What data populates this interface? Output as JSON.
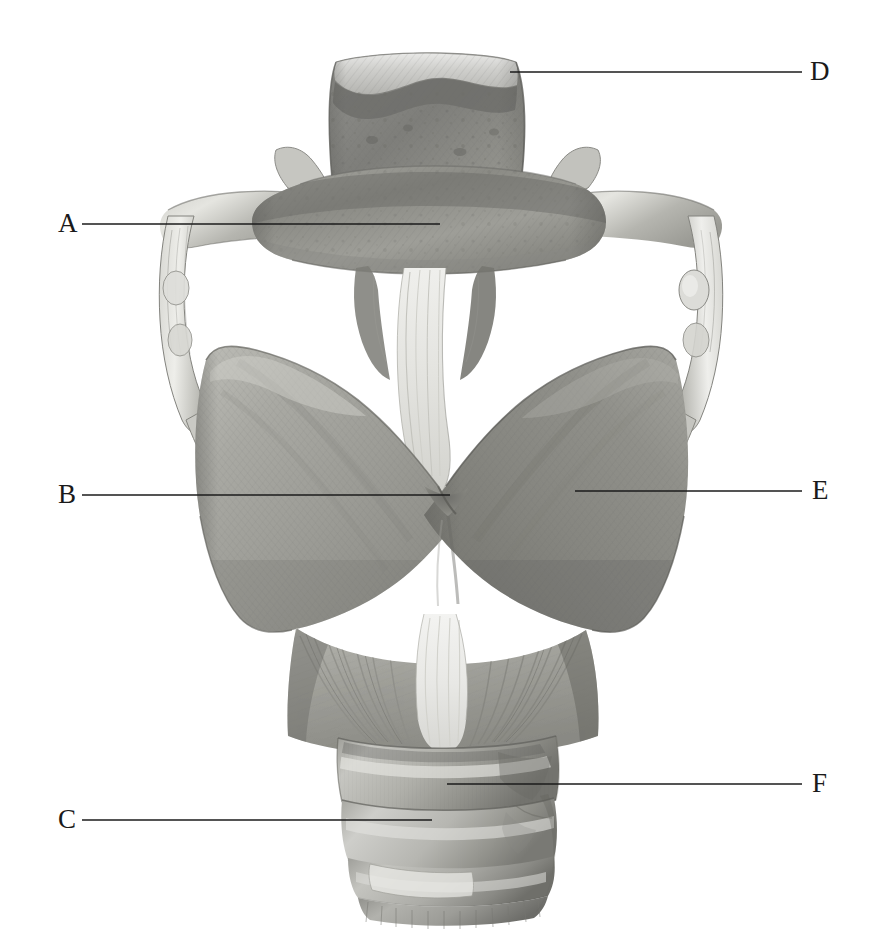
{
  "figure": {
    "background_color": "#ffffff",
    "ink_color": "#1b1b1b",
    "illustration_style": "grayscale graphite rendering",
    "width": 875,
    "height": 929
  },
  "labels": [
    {
      "id": "label-a",
      "text": "A",
      "side": "left",
      "text_x": 58,
      "text_y": 210,
      "line_x": 82,
      "line_y": 224,
      "line_width": 358,
      "points_to": "hyoid-bone-body"
    },
    {
      "id": "label-b",
      "text": "B",
      "side": "left",
      "text_x": 58,
      "text_y": 481,
      "line_x": 82,
      "line_y": 495,
      "line_width": 368,
      "points_to": "thyroid-cartilage-notch"
    },
    {
      "id": "label-c",
      "text": "C",
      "side": "left",
      "text_x": 58,
      "text_y": 806,
      "line_x": 82,
      "line_y": 820,
      "line_width": 350,
      "points_to": "tracheal-cartilage-ring"
    },
    {
      "id": "label-d",
      "text": "D",
      "side": "right",
      "text_x": 810,
      "text_y": 58,
      "line_x": 510,
      "line_y": 72,
      "line_width": 292,
      "points_to": "epiglottis-superior-border"
    },
    {
      "id": "label-e",
      "text": "E",
      "side": "right",
      "text_x": 812,
      "text_y": 479,
      "line_x": 575,
      "line_y": 491,
      "line_width": 227,
      "points_to": "thyroid-cartilage-lamina-right"
    },
    {
      "id": "label-f",
      "text": "F",
      "side": "right",
      "text_x": 812,
      "text_y": 770,
      "line_x": 447,
      "line_y": 784,
      "line_width": 355,
      "points_to": "cricoid-cartilage-lamina"
    }
  ],
  "structures": [
    {
      "id": "epiglottis",
      "name": "epiglottis"
    },
    {
      "id": "hyoid-bone",
      "name": "hyoid bone"
    },
    {
      "id": "greater-horn-left",
      "name": "greater horn of hyoid, left"
    },
    {
      "id": "greater-horn-right",
      "name": "greater horn of hyoid, right"
    },
    {
      "id": "lateral-thyrohyoid-ligament-left",
      "name": "lateral thyrohyoid ligament, left"
    },
    {
      "id": "lateral-thyrohyoid-ligament-right",
      "name": "lateral thyrohyoid ligament, right"
    },
    {
      "id": "triticeal-cartilage",
      "name": "triticeal cartilage"
    },
    {
      "id": "thyrohyoid-membrane",
      "name": "median thyrohyoid membrane"
    },
    {
      "id": "thyroid-lamina-left",
      "name": "thyroid cartilage lamina, left"
    },
    {
      "id": "thyroid-lamina-right",
      "name": "thyroid cartilage lamina, right"
    },
    {
      "id": "superior-horn-left",
      "name": "superior horn of thyroid cartilage, left"
    },
    {
      "id": "superior-horn-right",
      "name": "superior horn of thyroid cartilage, right"
    },
    {
      "id": "cricothyroid-muscle",
      "name": "cricothyroid muscle"
    },
    {
      "id": "cricothyroid-ligament",
      "name": "median cricothyroid ligament"
    },
    {
      "id": "cricoid-cartilage",
      "name": "cricoid cartilage"
    },
    {
      "id": "tracheal-rings",
      "name": "tracheal cartilage rings"
    }
  ]
}
